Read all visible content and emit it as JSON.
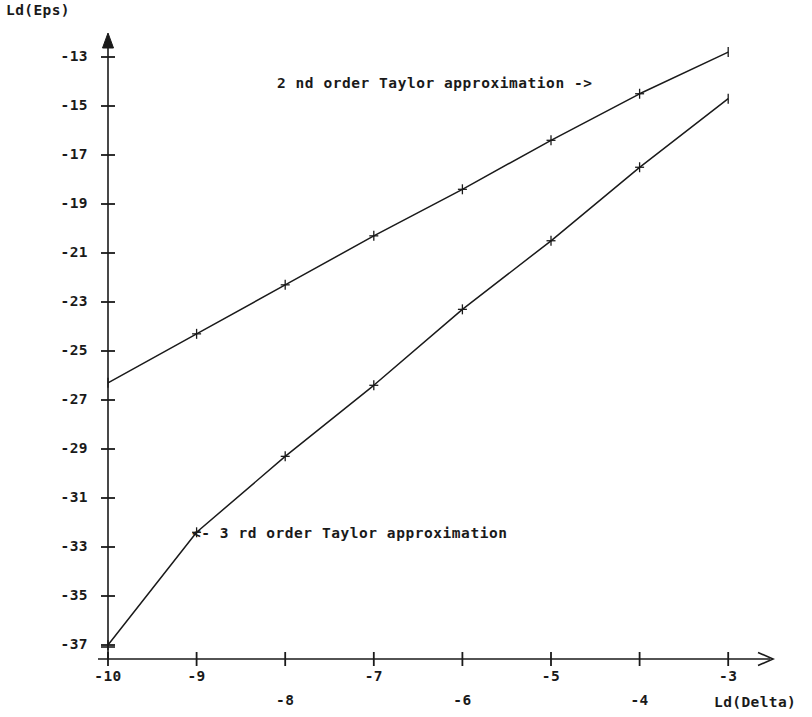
{
  "chart_data": {
    "type": "line",
    "title": "",
    "xlabel": "Ld(Delta)",
    "ylabel": "Ld(Eps)",
    "xlim": [
      -10.25,
      -2.8
    ],
    "ylim": [
      -38.2,
      -12.2
    ],
    "grid": false,
    "legend_position": "inline-annotations",
    "xticks": [
      -10,
      -9,
      -8,
      -7,
      -6,
      -5,
      -4,
      -3
    ],
    "xticklabels": [
      "-10",
      "-9",
      "-8",
      "-7",
      "-6",
      "-5",
      "-4",
      "-3"
    ],
    "yticks": [
      -13,
      -15,
      -17,
      -19,
      -21,
      -23,
      -25,
      -27,
      -29,
      -31,
      -33,
      -35,
      -37
    ],
    "yticklabels": [
      "-13",
      "-15",
      "-17",
      "-19",
      "-21",
      "-23",
      "-25",
      "-27",
      "-29",
      "-31",
      "-33",
      "-35",
      "-37"
    ],
    "x": [
      -10,
      -9,
      -8,
      -7,
      -6,
      -5,
      -4,
      -3
    ],
    "series": [
      {
        "name": "2 nd order Taylor approximation",
        "values": [
          -26.3,
          -24.3,
          -22.3,
          -20.3,
          -18.4,
          -16.4,
          -14.5,
          -12.8
        ],
        "color": "#1a1a1a",
        "marker": "plus"
      },
      {
        "name": "3 rd order Taylor approximation",
        "values": [
          -37.0,
          -32.4,
          -29.3,
          -26.4,
          -23.3,
          -20.5,
          -17.5,
          -14.7
        ],
        "color": "#1a1a1a",
        "marker": "plus"
      }
    ],
    "annotations": [
      {
        "text": "2 nd order Taylor approximation ->",
        "target_series": "2 nd order Taylor approximation"
      },
      {
        "text": "<- 3 rd order Taylor approximation",
        "target_series": "3 rd order Taylor approximation"
      }
    ]
  },
  "axes": {
    "y_axis_title": "Ld(Eps)",
    "x_axis_title": "Ld(Delta)"
  },
  "annotations": {
    "second_order": "2 nd order Taylor approximation ->",
    "third_order": "<- 3 rd order Taylor approximation"
  },
  "style": {
    "ink": "#1a1a1a",
    "background": "#ffffff"
  }
}
